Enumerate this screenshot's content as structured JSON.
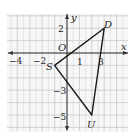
{
  "figure": {
    "type": "coordinate-plane-triangle",
    "axes": {
      "x_label": "x",
      "y_label": "y",
      "origin_label": "O",
      "x_tick_labels": [
        {
          "value": -4,
          "text": "−4"
        },
        {
          "value": -2,
          "text": "−2"
        },
        {
          "value": 1,
          "text": "1"
        },
        {
          "value": 3,
          "text": "3"
        }
      ],
      "y_tick_labels": [
        {
          "value": 2,
          "text": "2"
        },
        {
          "value": -3,
          "text": "−3"
        },
        {
          "value": -5,
          "text": "−5"
        }
      ],
      "x_range": [
        -5,
        4.5
      ],
      "y_range": [
        -6,
        3
      ],
      "grid": true
    },
    "triangle": {
      "vertices": [
        {
          "name": "S",
          "x": -1,
          "y": -1
        },
        {
          "name": "D",
          "x": 3,
          "y": 2
        },
        {
          "name": "U",
          "x": 2,
          "y": -5
        }
      ]
    },
    "colors": {
      "grid": "#c8c8c8",
      "axis": "#333333",
      "triangle": "#1a1a1a",
      "background": "#f7f7f7"
    }
  }
}
